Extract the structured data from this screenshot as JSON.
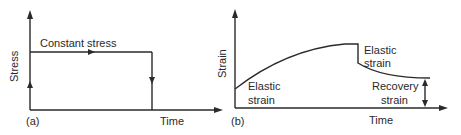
{
  "figure": {
    "panel_a": {
      "tag": "(a)",
      "y_label": "Stress",
      "x_label": "Time",
      "annotation": "Constant stress"
    },
    "panel_b": {
      "tag": "(b)",
      "y_label": "Strain",
      "x_label": "Time",
      "annotations": {
        "elastic_strain_loading_line1": "Elastic",
        "elastic_strain_loading_line2": "strain",
        "elastic_strain_unloading_line1": "Elastic",
        "elastic_strain_unloading_line2": "strain",
        "recovery_strain_line1": "Recovery",
        "recovery_strain_line2": "strain"
      }
    }
  },
  "colors": {
    "line": "#2a2a2a",
    "background": "#ffffff"
  }
}
